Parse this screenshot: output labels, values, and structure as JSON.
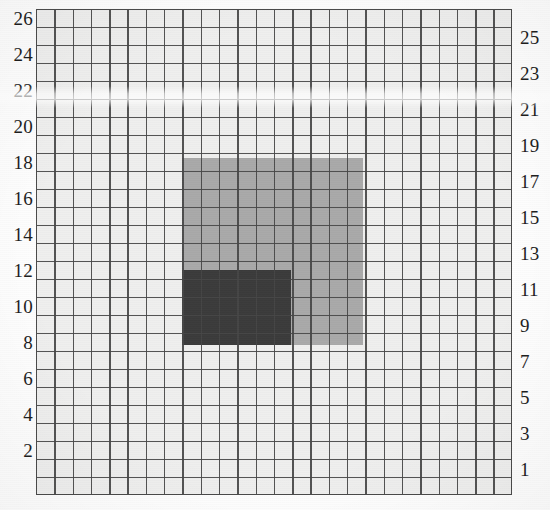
{
  "image": {
    "title": "Grid paper scan with two shaded rectangular regions",
    "width": 550,
    "height": 510,
    "background_color": "#fefefe"
  },
  "grid": {
    "columns": 26,
    "rows": 27,
    "cell_size_px": 18,
    "cell_fill_color": "#efefee",
    "line_color": "#464646",
    "border_color": "#4a4a4a",
    "left_px": 36,
    "top_px": 9,
    "width_px": 476,
    "height_px": 486
  },
  "axes": {
    "left": {
      "name": "even-row-numbers",
      "labels": [
        "26",
        "24",
        "22",
        "20",
        "18",
        "16",
        "14",
        "12",
        "10",
        "8",
        "6",
        "4",
        "2"
      ]
    },
    "right": {
      "name": "odd-row-numbers",
      "labels": [
        "25",
        "23",
        "21",
        "19",
        "17",
        "15",
        "13",
        "11",
        "9",
        "7",
        "5",
        "3",
        "1"
      ]
    }
  },
  "regions": [
    {
      "name": "outer-gray-region",
      "color": "#a9a9a9",
      "left_px": 146,
      "top_px": 149,
      "width_px": 181,
      "height_px": 187,
      "row_range": "9 to 18",
      "column_span": 10
    },
    {
      "name": "inner-dark-region",
      "color": "#3b3b3b",
      "left_px": 146,
      "top_px": 261,
      "width_px": 109,
      "height_px": 75,
      "row_range": "9 to 12",
      "column_span": 6
    }
  ],
  "chart_data": {
    "type": "heatmap",
    "xlabel": "",
    "ylabel": "",
    "grid": true,
    "legend": "none",
    "x": [
      1,
      2,
      3,
      4,
      5,
      6,
      7,
      8,
      9,
      10,
      11,
      12,
      13,
      14,
      15,
      16,
      17,
      18,
      19,
      20,
      21,
      22,
      23,
      24,
      25,
      26
    ],
    "y_left_ticks": [
      26,
      24,
      22,
      20,
      18,
      16,
      14,
      12,
      10,
      8,
      6,
      4,
      2
    ],
    "y_right_ticks": [
      25,
      23,
      21,
      19,
      17,
      15,
      13,
      11,
      9,
      7,
      5,
      3,
      1
    ],
    "ylim": [
      1,
      27
    ],
    "xlim": [
      1,
      26
    ],
    "shaded_rectangles": [
      {
        "label": "outer gray square",
        "fill": "#a9a9a9",
        "x_start_col": 9,
        "x_end_col": 18,
        "y_start_row": 9,
        "y_end_row": 18,
        "width_cells": 10,
        "height_cells": 10
      },
      {
        "label": "inner dark square",
        "fill": "#3b3b3b",
        "x_start_col": 9,
        "x_end_col": 14,
        "y_start_row": 9,
        "y_end_row": 12,
        "width_cells": 6,
        "height_cells": 4
      }
    ],
    "background_cells_color": "#efefee",
    "gridline_color": "#464646"
  },
  "artifacts": {
    "scan_band_label": "horizontal light scan band",
    "scan_noise_label": "scanner line noise"
  }
}
